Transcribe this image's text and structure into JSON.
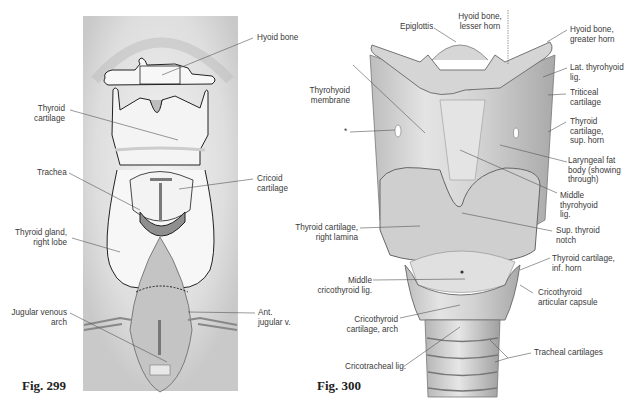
{
  "figures": [
    {
      "number": "Fig. 299",
      "labels": {
        "hyoid_bone": "Hyoid bone",
        "thyroid_cartilage": "Thyroid\ncartilage",
        "trachea": "Trachea",
        "cricoid_cartilage": "Cricoid\ncartilage",
        "thyroid_gland": "Thyroid gland,\nright lobe",
        "jugular_venous_arch": "Jugular venous\narch",
        "ant_jugular_v": "Ant.\njugular v."
      }
    },
    {
      "number": "Fig. 300",
      "labels": {
        "epiglottis": "Epiglottis",
        "hyoid_lesser_horn": "Hyoid bone,\nlesser horn",
        "hyoid_greater_horn": "Hyoid bone,\ngreater horn",
        "thyrohyoid_membrane": "Thyrohyoid\nmembrane",
        "lat_thyrohyoid_lig": "Lat. thyrohyoid\nlig.",
        "triticeal_cartilage": "Triticeal\ncartilage",
        "asterisk": "*",
        "thyroid_sup_horn": "Thyroid\ncartilage,\nsup. horn",
        "laryngeal_fat_body": "Laryngeal fat\nbody (showing\nthrough)",
        "middle_thyrohyoid_lig": "Middle\nthyrohyoid\nlig.",
        "thyroid_right_lamina": "Thyroid cartilage,\nright lamina",
        "sup_thyroid_notch": "Sup. thyroid\nnotch",
        "thyroid_inf_horn": "Thyroid cartilage,\ninf. horn",
        "middle_cricothyroid_lig": "Middle\ncricothyroid lig.",
        "cricothyroid_capsule": "Cricothyroid\narticular capsule",
        "cricothyroid_arch": "Cricothyroid\ncartilage, arch",
        "cricotracheal_lig": "Cricotracheal lig.",
        "tracheal_cartilages": "Tracheal cartilages"
      }
    }
  ]
}
